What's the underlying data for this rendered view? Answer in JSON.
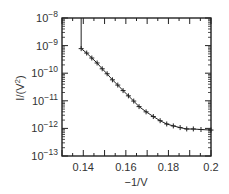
{
  "chart_data": {
    "type": "line",
    "title": "",
    "xlabel": "−1/V",
    "ylabel": "I/(V²)",
    "xlim": [
      0.13,
      0.2
    ],
    "ylim": [
      1e-13,
      1e-08
    ],
    "yscale": "log",
    "grid": false,
    "legend": null,
    "x_ticks": [
      {
        "value": 0.14,
        "label": "0.14"
      },
      {
        "value": 0.16,
        "label": "0.16"
      },
      {
        "value": 0.18,
        "label": "0.18"
      },
      {
        "value": 0.2,
        "label": "0.2"
      }
    ],
    "y_ticks": [
      {
        "exp": -8,
        "label_base": "10",
        "label_exp": "−8"
      },
      {
        "exp": -9,
        "label_base": "10",
        "label_exp": "−9"
      },
      {
        "exp": -10,
        "label_base": "10",
        "label_exp": "−10"
      },
      {
        "exp": -11,
        "label_base": "10",
        "label_exp": "−11"
      },
      {
        "exp": -12,
        "label_base": "10",
        "label_exp": "−12"
      },
      {
        "exp": -13,
        "label_base": "10",
        "label_exp": "−13"
      }
    ],
    "vertical_segment": {
      "x": 0.139,
      "y_top": 1e-08,
      "y_bottom": 7.8e-10
    },
    "series": [
      {
        "name": "I/V² vs −1/V",
        "marker": "+",
        "color": "#222222",
        "x": [
          0.139,
          0.1416,
          0.144,
          0.1465,
          0.1489,
          0.1512,
          0.1537,
          0.1562,
          0.1587,
          0.1612,
          0.1637,
          0.1662,
          0.1695,
          0.1729,
          0.1761,
          0.1792,
          0.1823,
          0.1855,
          0.1886,
          0.1917,
          0.1953,
          0.2
        ],
        "log10_y": [
          -9.11,
          -9.27,
          -9.45,
          -9.63,
          -9.84,
          -10.02,
          -10.24,
          -10.43,
          -10.63,
          -10.82,
          -11.01,
          -11.21,
          -11.4,
          -11.57,
          -11.72,
          -11.84,
          -11.91,
          -11.97,
          -12.02,
          -12.02,
          -12.04,
          -12.06
        ],
        "values": [
          7.8e-10,
          5.4e-10,
          3.5e-10,
          2.3e-10,
          1.4e-10,
          9.5e-11,
          5.8e-11,
          3.7e-11,
          2.3e-11,
          1.5e-11,
          9.8e-12,
          6.2e-12,
          4e-12,
          2.7e-12,
          1.9e-12,
          1.4e-12,
          1.2e-12,
          1.07e-12,
          9.5e-13,
          9.5e-13,
          9.1e-13,
          8.7e-13
        ]
      }
    ]
  }
}
